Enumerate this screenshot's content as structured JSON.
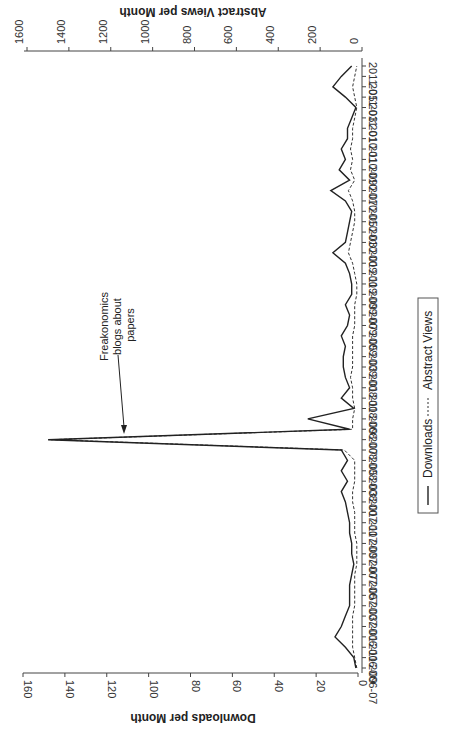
{
  "chart_data": {
    "type": "line",
    "orientation": "rotated-90-clockwise",
    "title": "",
    "xlabel": "",
    "ylabel_left": "Downloads per Month",
    "ylabel_right": "Abstract Views per Month",
    "ylim_downloads": [
      0,
      160
    ],
    "ylim_abstract_views": [
      0,
      1600
    ],
    "downloads_ticks": [
      0,
      20,
      40,
      60,
      80,
      100,
      120,
      140,
      160
    ],
    "abstract_views_ticks": [
      0,
      200,
      400,
      600,
      800,
      1000,
      1200,
      1400,
      1600
    ],
    "x_tick_labels": [
      "2006-07",
      "2006-09",
      "2006-11",
      "2007-01",
      "2007-03",
      "2007-05",
      "2007-07",
      "2007-09",
      "2007-11",
      "2008-01",
      "2008-03",
      "2008-05",
      "2008-07",
      "2008-09",
      "2008-11",
      "2009-01",
      "2009-03",
      "2009-05",
      "2009-07",
      "2009-09",
      "2009-11",
      "2010-01",
      "2010-03",
      "2010-05",
      "2010-07",
      "2010-09",
      "2010-11",
      "2011-01",
      "2011-03",
      "2011-05"
    ],
    "x": [
      "2006-07",
      "2006-08",
      "2006-09",
      "2006-10",
      "2006-11",
      "2006-12",
      "2007-01",
      "2007-02",
      "2007-03",
      "2007-04",
      "2007-05",
      "2007-06",
      "2007-07",
      "2007-08",
      "2007-09",
      "2007-10",
      "2007-11",
      "2007-12",
      "2008-01",
      "2008-02",
      "2008-03",
      "2008-04",
      "2008-05",
      "2008-06",
      "2008-07",
      "2008-08",
      "2008-09",
      "2008-10",
      "2008-11",
      "2008-12",
      "2009-01",
      "2009-02",
      "2009-03",
      "2009-04",
      "2009-05",
      "2009-06",
      "2009-07",
      "2009-08",
      "2009-09",
      "2009-10",
      "2009-11",
      "2009-12",
      "2010-01",
      "2010-02",
      "2010-03",
      "2010-04",
      "2010-05",
      "2010-06",
      "2010-07",
      "2010-08",
      "2010-09",
      "2010-10",
      "2010-11",
      "2010-12",
      "2011-01",
      "2011-02",
      "2011-03",
      "2011-04",
      "2011-05"
    ],
    "series": [
      {
        "name": "Downloads",
        "axis": "left",
        "style": "solid",
        "values": [
          1,
          2,
          6,
          11,
          8,
          6,
          4,
          4,
          4,
          3,
          2,
          3,
          3,
          4,
          4,
          5,
          6,
          8,
          5,
          8,
          5,
          8,
          148,
          4,
          24,
          2,
          8,
          4,
          6,
          7,
          7,
          6,
          8,
          5,
          4,
          6,
          3,
          3,
          4,
          6,
          12,
          6,
          5,
          4,
          3,
          6,
          13,
          4,
          9,
          6,
          8,
          5,
          5,
          3,
          1,
          6,
          12,
          8,
          3
        ]
      },
      {
        "name": "Abstract Views",
        "axis": "right",
        "style": "dashed",
        "values": [
          20,
          30,
          40,
          40,
          40,
          40,
          30,
          30,
          30,
          30,
          20,
          20,
          20,
          30,
          30,
          30,
          40,
          40,
          30,
          30,
          30,
          80,
          1480,
          40,
          40,
          30,
          40,
          40,
          50,
          40,
          40,
          40,
          40,
          30,
          30,
          30,
          20,
          20,
          30,
          40,
          60,
          50,
          40,
          30,
          30,
          40,
          60,
          30,
          50,
          40,
          50,
          40,
          40,
          30,
          20,
          30,
          40,
          30,
          20
        ]
      }
    ],
    "annotations": [
      {
        "text": "Freakonomics blogs about papers",
        "x": "2008-05",
        "arrow": true
      }
    ],
    "legend": {
      "position": "bottom-right (rotated)",
      "entries": [
        "Downloads",
        "Abstract Views"
      ]
    },
    "grid": false
  },
  "labels": {
    "downloads_axis_title": "Downloads per Month",
    "views_axis_title": "Abstract Views per Month",
    "annotation_line1": "Freakonomics",
    "annotation_line2": "blogs about",
    "annotation_line3": "papers",
    "legend_downloads": "Downloads",
    "legend_views": "Abstract Views"
  }
}
